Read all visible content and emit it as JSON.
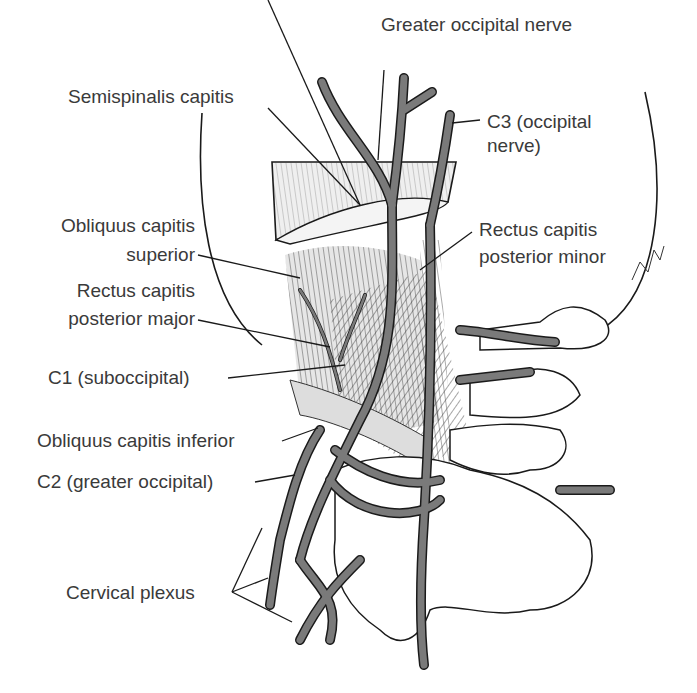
{
  "figure": {
    "labels": {
      "greater_occipital_nerve": "Greater occipital nerve",
      "semispinalis_capitis": "Semispinalis capitis",
      "c3_line1": "C3 (occipital",
      "c3_line2": "nerve)",
      "obliquus_superior_line1": "Obliquus capitis",
      "obliquus_superior_line2": "superior",
      "rcp_minor_line1": "Rectus capitis",
      "rcp_minor_line2": "posterior minor",
      "rcp_major_line1": "Rectus capitis",
      "rcp_major_line2": "posterior major",
      "c1": "C1 (suboccipital)",
      "obliquus_inferior": "Obliquus capitis inferior",
      "c2": "C2 (greater occipital)",
      "cervical_plexus": "Cervical plexus"
    },
    "colors": {
      "nerve_fill": "#7a7a7a",
      "outline": "#1a1a1a",
      "muscle_shade": "#e6e6e6",
      "label_text": "#3a3a3a"
    }
  }
}
